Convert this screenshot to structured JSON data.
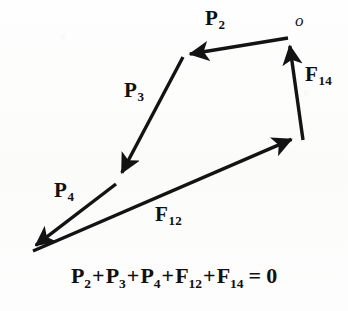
{
  "figure": {
    "kind": "force-polygon-vector-diagram",
    "background_color": "#fdfdfc",
    "ink_color": "#141313",
    "stroke_width_px": 3.4,
    "origin_label": "o",
    "equation": {
      "terms": [
        {
          "symbol": "P",
          "sub": "2"
        },
        {
          "symbol": "P",
          "sub": "3"
        },
        {
          "symbol": "P",
          "sub": "4"
        },
        {
          "symbol": "F",
          "sub": "12"
        },
        {
          "symbol": "F",
          "sub": "14"
        }
      ],
      "operator": "+",
      "equals": "=",
      "result": "0",
      "plain_text": "P2 + P3 + P4 + F12 + F14 = 0"
    },
    "vectors": [
      {
        "id": "p2",
        "symbol": "P",
        "sub": "2",
        "label": "P2",
        "from": {
          "x": 288,
          "y": 38
        },
        "to": {
          "x": 184,
          "y": 55
        },
        "label_pos": {
          "x": 205,
          "y": 8
        },
        "direction": "left"
      },
      {
        "id": "p3",
        "symbol": "P",
        "sub": "3",
        "label": "P3",
        "from": {
          "x": 183,
          "y": 57
        },
        "to": {
          "x": 119,
          "y": 178
        },
        "label_pos": {
          "x": 124,
          "y": 80
        },
        "direction": "down-left"
      },
      {
        "id": "p4",
        "symbol": "P",
        "sub": "4",
        "label": "P4",
        "from": {
          "x": 116,
          "y": 184
        },
        "to": {
          "x": 31,
          "y": 249
        },
        "label_pos": {
          "x": 54,
          "y": 180
        },
        "direction": "down-left"
      },
      {
        "id": "f12",
        "symbol": "F",
        "sub": "12",
        "label": "F12",
        "from": {
          "x": 33,
          "y": 251
        },
        "to": {
          "x": 297,
          "y": 137
        },
        "label_pos": {
          "x": 155,
          "y": 204
        },
        "direction": "up-right"
      },
      {
        "id": "f14",
        "symbol": "F",
        "sub": "14",
        "label": "F14",
        "from": {
          "x": 303,
          "y": 140
        },
        "to": {
          "x": 289,
          "y": 40
        },
        "label_pos": {
          "x": 305,
          "y": 64
        },
        "direction": "up"
      }
    ]
  }
}
